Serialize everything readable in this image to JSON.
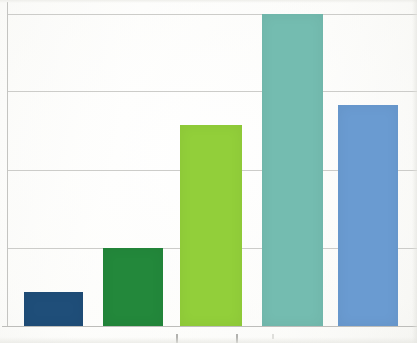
{
  "chart_data": {
    "type": "bar",
    "title": "",
    "subtitle": "",
    "xlabel": "",
    "ylabel": "",
    "categories": [
      "",
      "",
      "",
      "",
      ""
    ],
    "values": [
      0.11,
      0.25,
      0.64,
      1.0,
      0.71
    ],
    "ylim": [
      0,
      1.0
    ],
    "grid": true,
    "gridlines": [
      0.25,
      0.5,
      0.75,
      1.0
    ],
    "legend": "none",
    "tick_labels_x": [],
    "tick_labels_y": [],
    "series": [
      {
        "name": "bars",
        "values": [
          0.11,
          0.25,
          0.64,
          1.0,
          0.71
        ],
        "colors": [
          "#1f4e79",
          "#23883b",
          "#92cf3a",
          "#74bcb0",
          "#6a9bd1"
        ]
      }
    ]
  },
  "figure": {
    "background_color": "#fbfbf9",
    "axis_color": "#c4c4c1",
    "gridline_color": "#c9c9c6"
  },
  "bars": [
    {
      "name": "bar-1",
      "color": "#1f4e79",
      "left": 24,
      "width": 59,
      "top": 292,
      "value": 0.11
    },
    {
      "name": "bar-2",
      "color": "#23883b",
      "left": 103,
      "width": 60,
      "top": 248,
      "value": 0.25
    },
    {
      "name": "bar-3",
      "color": "#92cf3a",
      "left": 180,
      "width": 62,
      "top": 125,
      "value": 0.64
    },
    {
      "name": "bar-4",
      "color": "#74bcb0",
      "left": 262,
      "width": 61,
      "top": 14,
      "value": 1.0
    },
    {
      "name": "bar-5",
      "color": "#6a9bd1",
      "left": 338,
      "width": 60,
      "top": 105,
      "value": 0.71
    }
  ],
  "gridlines_px": [
    14,
    91,
    170,
    248
  ],
  "axis": {
    "y_left_px": 7,
    "y_top_px": 2,
    "y_height_px": 325,
    "x_baseline_px": 326
  },
  "axis_glyph_marks": [
    {
      "left": 176,
      "faint": false
    },
    {
      "left": 236,
      "faint": false
    },
    {
      "left": 272,
      "faint": true
    }
  ]
}
